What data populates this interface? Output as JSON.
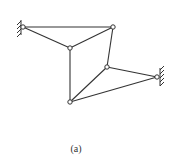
{
  "figure": {
    "caption": "(a)",
    "stroke_color": "#333333",
    "nodes": [
      {
        "id": "A",
        "x": 23,
        "y": 27,
        "support": "left-wall"
      },
      {
        "id": "B",
        "x": 113,
        "y": 27
      },
      {
        "id": "C",
        "x": 70,
        "y": 48
      },
      {
        "id": "D",
        "x": 107,
        "y": 67
      },
      {
        "id": "E",
        "x": 157,
        "y": 77,
        "support": "right-wall"
      },
      {
        "id": "F",
        "x": 70,
        "y": 102
      }
    ],
    "members": [
      [
        "A",
        "B"
      ],
      [
        "A",
        "C"
      ],
      [
        "B",
        "C"
      ],
      [
        "B",
        "D"
      ],
      [
        "C",
        "F"
      ],
      [
        "D",
        "F"
      ],
      [
        "D",
        "E"
      ],
      [
        "F",
        "E"
      ]
    ]
  }
}
